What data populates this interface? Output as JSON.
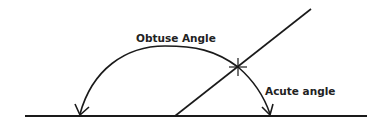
{
  "diagram": {
    "type": "angle-illustration",
    "labels": {
      "obtuse": "Obtuse Angle",
      "acute": "Acute angle"
    },
    "colors": {
      "stroke": "#1a1a1a",
      "text": "#222222",
      "background": "#ffffff"
    },
    "elements": {
      "baseline": "horizontal line",
      "transversal": "slanted line crossing the baseline",
      "obtuse_arc": "arc with arrowhead on left",
      "acute_arc": "arc with arrowhead on right",
      "intersection_marker": "star mark where arc meets transversal"
    }
  }
}
